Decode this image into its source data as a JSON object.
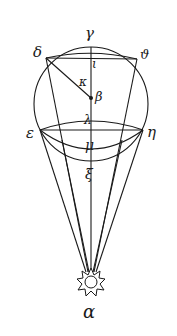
{
  "figure": {
    "type": "geometric-optics-diagram",
    "stroke_color": "#1a1a1a",
    "background": "#ffffff",
    "labels": {
      "gamma": "γ",
      "delta": "δ",
      "theta": "ϑ",
      "iota": "ι",
      "kappa": "κ",
      "beta": "β",
      "lambda": "λ",
      "epsilon": "ε",
      "eta": "η",
      "mu": "μ",
      "xi": "ξ",
      "alpha": "α"
    },
    "icons": {
      "sun": "sun-icon"
    }
  }
}
